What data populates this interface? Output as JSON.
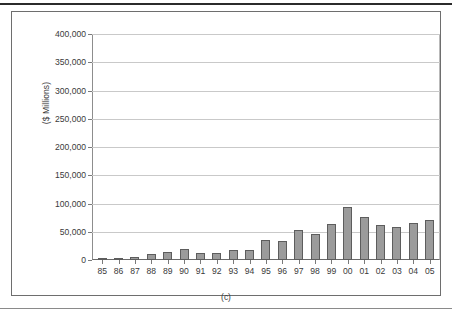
{
  "figure": {
    "caption": "(c)"
  },
  "chart_data": {
    "type": "bar",
    "title": "",
    "xlabel": "",
    "ylabel": "($ Millions)",
    "ylim": [
      0,
      400000
    ],
    "ytick_labels": [
      "400,000",
      "350,000",
      "300,000",
      "250,000",
      "200,000",
      "150,000",
      "100,000",
      "50,000",
      "0"
    ],
    "ytick_values": [
      400000,
      350000,
      300000,
      250000,
      200000,
      150000,
      100000,
      50000,
      0
    ],
    "grid": true,
    "legend": "none",
    "bar_color": "#9b9b9b",
    "bar_edge_color": "#5d5d5d",
    "categories": [
      "85",
      "86",
      "87",
      "88",
      "89",
      "90",
      "91",
      "92",
      "93",
      "94",
      "95",
      "96",
      "97",
      "98",
      "99",
      "00",
      "01",
      "02",
      "03",
      "04",
      "05"
    ],
    "values": [
      200,
      700,
      5500,
      11500,
      13500,
      20000,
      12500,
      12000,
      18500,
      17000,
      36000,
      34000,
      53000,
      46000,
      64000,
      94000,
      76000,
      62000,
      59000,
      66000,
      71000
    ]
  }
}
